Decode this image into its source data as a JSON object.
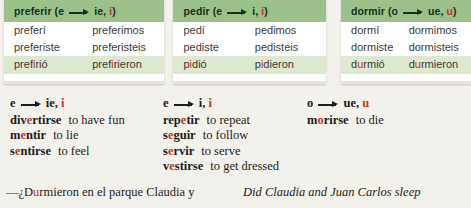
{
  "colors": {
    "header_green": "#9cc089",
    "row_alt_green": "#dde8cf",
    "accent_red": "#cc3322",
    "page_bg": "#f3f1eb"
  },
  "tables": [
    {
      "title_pre": "preferir (e",
      "title_post_a": "ie, ",
      "title_post_hl": "i",
      "title_close": ")",
      "rows": [
        {
          "left_pre": "prefer",
          "left_hl": "",
          "left_post": "í",
          "right_pre": "prefer",
          "right_hl": "",
          "right_post": "imos"
        },
        {
          "left_pre": "prefer",
          "left_hl": "",
          "left_post": "iste",
          "right_pre": "prefer",
          "right_hl": "",
          "right_post": "isteis"
        },
        {
          "left_pre": "pref",
          "left_hl": "i",
          "left_post": "rió",
          "right_pre": "pref",
          "right_hl": "i",
          "right_post": "rieron"
        }
      ]
    },
    {
      "title_pre": "pedir (e",
      "title_post_a": "i, ",
      "title_post_hl": "i",
      "title_close": ")",
      "rows": [
        {
          "left_pre": "ped",
          "left_hl": "",
          "left_post": "í",
          "right_pre": "ped",
          "right_hl": "",
          "right_post": "imos"
        },
        {
          "left_pre": "ped",
          "left_hl": "",
          "left_post": "iste",
          "right_pre": "ped",
          "right_hl": "",
          "right_post": "isteis"
        },
        {
          "left_pre": "p",
          "left_hl": "i",
          "left_post": "dió",
          "right_pre": "p",
          "right_hl": "i",
          "right_post": "dieron"
        }
      ]
    },
    {
      "title_pre": "dormir (o",
      "title_post_a": "ue, ",
      "title_post_hl": "u",
      "title_close": ")",
      "rows": [
        {
          "left_pre": "dorm",
          "left_hl": "",
          "left_post": "í",
          "right_pre": "dorm",
          "right_hl": "",
          "right_post": "imos"
        },
        {
          "left_pre": "dorm",
          "left_hl": "",
          "left_post": "iste",
          "right_pre": "dorm",
          "right_hl": "",
          "right_post": "isteis"
        },
        {
          "left_pre": "d",
          "left_hl": "u",
          "left_post": "rmió",
          "right_pre": "d",
          "right_hl": "u",
          "right_post": "rmieron"
        }
      ]
    }
  ],
  "lists": [
    {
      "head_pre": "e",
      "head_post": "ie, ",
      "head_hl": "i",
      "items": [
        {
          "pre": "div",
          "hl": "e",
          "post": "rtirse",
          "gloss": "to have fun"
        },
        {
          "pre": "m",
          "hl": "e",
          "post": "ntir",
          "gloss": "to lie"
        },
        {
          "pre": "s",
          "hl": "e",
          "post": "ntirse",
          "gloss": "to feel"
        }
      ]
    },
    {
      "head_pre": "e",
      "head_post": "i, ",
      "head_hl": "i",
      "items": [
        {
          "pre": "rep",
          "hl": "e",
          "post": "tir",
          "gloss": "to repeat"
        },
        {
          "pre": "s",
          "hl": "e",
          "post": "guir",
          "gloss": "to follow"
        },
        {
          "pre": "s",
          "hl": "e",
          "post": "rvir",
          "gloss": "to serve"
        },
        {
          "pre": "v",
          "hl": "e",
          "post": "stirse",
          "gloss": "to get dressed"
        }
      ]
    },
    {
      "head_pre": "o",
      "head_post": "ue, ",
      "head_hl": "u",
      "items": [
        {
          "pre": "m",
          "hl": "o",
          "post": "rirse",
          "gloss": "to die"
        }
      ]
    }
  ],
  "example": {
    "spanish_pre": "—¿D",
    "spanish_hl": "u",
    "spanish_post": "rmieron en el parque Claudia y",
    "english": "Did Claudia and Juan Carlos sleep"
  }
}
